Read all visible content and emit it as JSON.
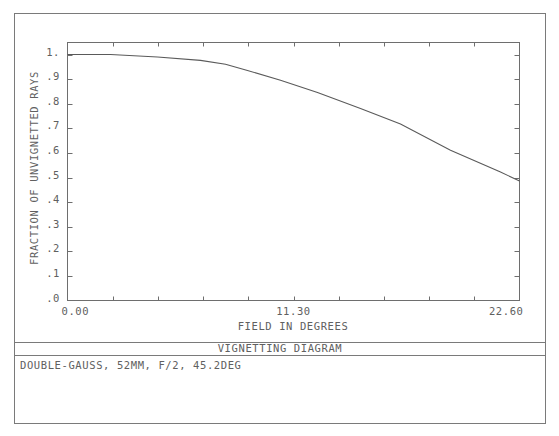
{
  "chart_data": {
    "type": "line",
    "title": "VIGNETTING DIAGRAM",
    "description": "DOUBLE-GAUSS, 52MM, F/2, 45.2DEG",
    "xlabel": "FIELD IN DEGREES",
    "ylabel": "FRACTION OF UNVIGNETTED RAYS",
    "xlim": [
      0,
      22.6
    ],
    "ylim": [
      0,
      1.05
    ],
    "x_tick_labels": [
      "0.00",
      "11.30",
      "22.60"
    ],
    "x_tick_label_values": [
      0,
      11.3,
      22.6
    ],
    "x_minor_tick_step": 2.26,
    "y_tick_labels": [
      ".0",
      ".1",
      ".2",
      ".3",
      ".4",
      ".5",
      ".6",
      ".7",
      ".8",
      ".9",
      "1."
    ],
    "y_tick_values": [
      0,
      0.1,
      0.2,
      0.3,
      0.4,
      0.5,
      0.6,
      0.7,
      0.8,
      0.9,
      1.0
    ],
    "grid": false,
    "series": [
      {
        "name": "vignetting",
        "x": [
          0.0,
          2.15,
          4.5,
          6.65,
          7.9,
          9.0,
          10.65,
          12.5,
          14.65,
          16.65,
          19.15,
          21.65,
          22.6
        ],
        "y": [
          1.0,
          1.0,
          0.99,
          0.976,
          0.96,
          0.935,
          0.895,
          0.845,
          0.781,
          0.717,
          0.611,
          0.522,
          0.486
        ]
      }
    ]
  }
}
